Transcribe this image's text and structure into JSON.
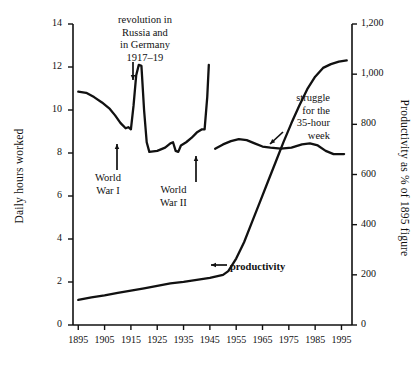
{
  "chart_data": {
    "type": "line",
    "title": "",
    "xlabel": "",
    "grid": false,
    "legend_position": "none",
    "x": [
      1895,
      1905,
      1915,
      1925,
      1935,
      1945,
      1955,
      1965,
      1975,
      1985,
      1995
    ],
    "xlim": [
      1893,
      1999
    ],
    "xticks": [
      "1895",
      "1905",
      "1915",
      "1925",
      "1935",
      "1945",
      "1955",
      "1965",
      "1975",
      "1985",
      "1995"
    ],
    "axes": [
      {
        "id": "left",
        "label": "Daily hours worked",
        "ylim": [
          0,
          14
        ],
        "yticks": [
          "0",
          "2",
          "4",
          "6",
          "8",
          "10",
          "12",
          "14"
        ],
        "ytick_values": [
          0,
          2,
          4,
          6,
          8,
          10,
          12,
          14
        ]
      },
      {
        "id": "right",
        "label": "Productivity as % of 1895 figure",
        "ylim": [
          0,
          1200
        ],
        "yticks": [
          "0",
          "200",
          "400",
          "600",
          "800",
          "1,000",
          "1,200"
        ],
        "ytick_values": [
          0,
          200,
          400,
          600,
          800,
          1000,
          1200
        ]
      }
    ],
    "series": [
      {
        "name": "Daily hours worked",
        "axis": "left",
        "segments": [
          {
            "name": "hours-pre-ww2",
            "points": [
              [
                1895,
                10.85
              ],
              [
                1898,
                10.8
              ],
              [
                1901,
                10.6
              ],
              [
                1904,
                10.35
              ],
              [
                1907,
                10.05
              ],
              [
                1909,
                9.75
              ],
              [
                1911,
                9.4
              ],
              [
                1913,
                9.15
              ],
              [
                1914,
                9.2
              ],
              [
                1915,
                9.1
              ],
              [
                1916,
                10.2
              ],
              [
                1917,
                11.6
              ],
              [
                1918,
                12.1
              ],
              [
                1919,
                12.05
              ],
              [
                1920,
                10.0
              ],
              [
                1921,
                8.5
              ],
              [
                1922,
                8.05
              ],
              [
                1925,
                8.1
              ],
              [
                1928,
                8.25
              ],
              [
                1930,
                8.45
              ],
              [
                1931,
                8.5
              ],
              [
                1932,
                8.1
              ],
              [
                1933,
                8.05
              ],
              [
                1934,
                8.35
              ],
              [
                1936,
                8.5
              ],
              [
                1938,
                8.7
              ],
              [
                1940,
                8.95
              ],
              [
                1942,
                9.1
              ],
              [
                1943,
                9.1
              ],
              [
                1944,
                10.6
              ],
              [
                1944.6,
                12.1
              ]
            ]
          },
          {
            "name": "hours-post-ww2",
            "points": [
              [
                1947,
                8.2
              ],
              [
                1950,
                8.4
              ],
              [
                1953,
                8.55
              ],
              [
                1956,
                8.65
              ],
              [
                1959,
                8.6
              ],
              [
                1962,
                8.45
              ],
              [
                1965,
                8.3
              ],
              [
                1968,
                8.25
              ],
              [
                1972,
                8.2
              ],
              [
                1976,
                8.25
              ],
              [
                1980,
                8.4
              ],
              [
                1983,
                8.45
              ],
              [
                1986,
                8.35
              ],
              [
                1989,
                8.1
              ],
              [
                1992,
                7.95
              ],
              [
                1996,
                7.95
              ]
            ]
          }
        ]
      },
      {
        "name": "productivity",
        "axis": "right",
        "segments": [
          {
            "name": "productivity-curve",
            "points": [
              [
                1895,
                100
              ],
              [
                1900,
                110
              ],
              [
                1905,
                118
              ],
              [
                1910,
                128
              ],
              [
                1915,
                137
              ],
              [
                1920,
                146
              ],
              [
                1925,
                156
              ],
              [
                1930,
                166
              ],
              [
                1935,
                172
              ],
              [
                1940,
                180
              ],
              [
                1945,
                188
              ],
              [
                1950,
                200
              ],
              [
                1952,
                215
              ],
              [
                1955,
                265
              ],
              [
                1958,
                330
              ],
              [
                1961,
                410
              ],
              [
                1964,
                490
              ],
              [
                1967,
                570
              ],
              [
                1970,
                650
              ],
              [
                1973,
                730
              ],
              [
                1976,
                805
              ],
              [
                1979,
                875
              ],
              [
                1982,
                940
              ],
              [
                1985,
                990
              ],
              [
                1988,
                1025
              ],
              [
                1991,
                1040
              ],
              [
                1994,
                1050
              ],
              [
                1997,
                1055
              ]
            ]
          }
        ]
      }
    ],
    "annotations": [
      {
        "name": "revolution-annotation",
        "lines": [
          "revolution in",
          "Russia and",
          "in Germany",
          "1917–19"
        ],
        "arrow": "down"
      },
      {
        "name": "world-war-1-annotation",
        "lines": [
          "World",
          "War I"
        ],
        "arrow": "up"
      },
      {
        "name": "world-war-2-annotation",
        "lines": [
          "World",
          "War II"
        ],
        "arrow": "up"
      },
      {
        "name": "thirty-five-hour-week-annotation",
        "lines": [
          "struggle",
          "for the",
          "35-hour",
          "week"
        ],
        "arrow": "down-left"
      },
      {
        "name": "productivity-annotation",
        "lines": [
          "productivity"
        ],
        "arrow": "left"
      }
    ],
    "colors": {
      "line": "#111111",
      "axis": "#111111",
      "background": "#ffffff"
    }
  }
}
